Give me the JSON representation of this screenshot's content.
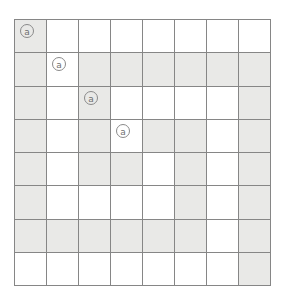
{
  "figure": {
    "name": "shaded-grid-diagram",
    "rows": 8,
    "columns": 8,
    "colors": {
      "background": "#ffffff",
      "shaded_cell": "#e9e9e7",
      "empty_cell": "#ffffff",
      "grid_line": "#868686",
      "outer_border": "#7a7a7a",
      "token": "#6f6f6f"
    },
    "token_glyph": "a",
    "token_label": "at-sign-token",
    "cells": [
      [
        {
          "shaded": true,
          "token": "a"
        },
        {
          "shaded": false,
          "token": ""
        },
        {
          "shaded": false,
          "token": ""
        },
        {
          "shaded": false,
          "token": ""
        },
        {
          "shaded": false,
          "token": ""
        },
        {
          "shaded": false,
          "token": ""
        },
        {
          "shaded": false,
          "token": ""
        },
        {
          "shaded": false,
          "token": ""
        }
      ],
      [
        {
          "shaded": true,
          "token": ""
        },
        {
          "shaded": false,
          "token": "a"
        },
        {
          "shaded": true,
          "token": ""
        },
        {
          "shaded": true,
          "token": ""
        },
        {
          "shaded": true,
          "token": ""
        },
        {
          "shaded": true,
          "token": ""
        },
        {
          "shaded": true,
          "token": ""
        },
        {
          "shaded": true,
          "token": ""
        }
      ],
      [
        {
          "shaded": true,
          "token": ""
        },
        {
          "shaded": false,
          "token": ""
        },
        {
          "shaded": true,
          "token": "a"
        },
        {
          "shaded": false,
          "token": ""
        },
        {
          "shaded": false,
          "token": ""
        },
        {
          "shaded": false,
          "token": ""
        },
        {
          "shaded": false,
          "token": ""
        },
        {
          "shaded": true,
          "token": ""
        }
      ],
      [
        {
          "shaded": true,
          "token": ""
        },
        {
          "shaded": false,
          "token": ""
        },
        {
          "shaded": true,
          "token": ""
        },
        {
          "shaded": false,
          "token": "a"
        },
        {
          "shaded": true,
          "token": ""
        },
        {
          "shaded": true,
          "token": ""
        },
        {
          "shaded": false,
          "token": ""
        },
        {
          "shaded": true,
          "token": ""
        }
      ],
      [
        {
          "shaded": true,
          "token": ""
        },
        {
          "shaded": false,
          "token": ""
        },
        {
          "shaded": true,
          "token": ""
        },
        {
          "shaded": true,
          "token": ""
        },
        {
          "shaded": false,
          "token": ""
        },
        {
          "shaded": true,
          "token": ""
        },
        {
          "shaded": false,
          "token": ""
        },
        {
          "shaded": true,
          "token": ""
        }
      ],
      [
        {
          "shaded": true,
          "token": ""
        },
        {
          "shaded": false,
          "token": ""
        },
        {
          "shaded": false,
          "token": ""
        },
        {
          "shaded": false,
          "token": ""
        },
        {
          "shaded": false,
          "token": ""
        },
        {
          "shaded": true,
          "token": ""
        },
        {
          "shaded": false,
          "token": ""
        },
        {
          "shaded": true,
          "token": ""
        }
      ],
      [
        {
          "shaded": true,
          "token": ""
        },
        {
          "shaded": true,
          "token": ""
        },
        {
          "shaded": true,
          "token": ""
        },
        {
          "shaded": true,
          "token": ""
        },
        {
          "shaded": true,
          "token": ""
        },
        {
          "shaded": true,
          "token": ""
        },
        {
          "shaded": false,
          "token": ""
        },
        {
          "shaded": true,
          "token": ""
        }
      ],
      [
        {
          "shaded": false,
          "token": ""
        },
        {
          "shaded": false,
          "token": ""
        },
        {
          "shaded": false,
          "token": ""
        },
        {
          "shaded": false,
          "token": ""
        },
        {
          "shaded": false,
          "token": ""
        },
        {
          "shaded": false,
          "token": ""
        },
        {
          "shaded": false,
          "token": ""
        },
        {
          "shaded": true,
          "token": ""
        }
      ]
    ]
  }
}
